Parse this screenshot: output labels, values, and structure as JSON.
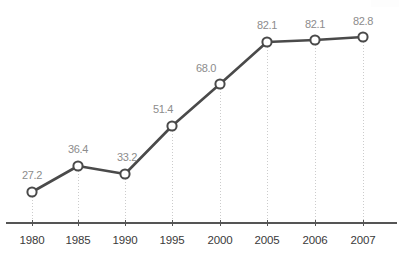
{
  "chart_data": {
    "type": "line",
    "title": "",
    "subtitle": "",
    "xlabel": "",
    "ylabel": "",
    "grid": true,
    "gridlines": "vertical-dotted",
    "legend": "none",
    "categories": [
      "1980",
      "1985",
      "1990",
      "1995",
      "2000",
      "2005",
      "2006",
      "2007"
    ],
    "values": [
      27.2,
      36.4,
      33.2,
      51.4,
      68.0,
      82.1,
      82.1,
      82.8
    ],
    "point_labels": [
      "27.2",
      "36.4",
      "33.2",
      "51.4",
      "68.0",
      "82.1",
      "82.1",
      "82.8"
    ],
    "tick_labels": [
      "1980",
      "1985",
      "1990",
      "1995",
      "2000",
      "2005",
      "2006",
      "2007"
    ],
    "ylim": [
      0,
      82.8
    ],
    "xlim": [
      "1980",
      "2007"
    ],
    "series": [
      {
        "name": "",
        "values": [
          27.2,
          36.4,
          33.2,
          51.4,
          68.0,
          82.1,
          82.1,
          82.8
        ]
      }
    ],
    "marker": "open-circle",
    "colors": {
      "line": "#4a4a4a",
      "marker_fill": "#ffffff",
      "marker_stroke": "#4a4a4a",
      "axis": "#555555",
      "gridline": "#cccccc",
      "value_label": "#8c8c8c",
      "tick_label": "#3a3a3a",
      "background": "#ffffff"
    },
    "points": [
      {
        "category": "1980",
        "value": 27.2,
        "label": "27.2",
        "px": 32,
        "py": 192,
        "lx": 32,
        "ly": 170
      },
      {
        "category": "1985",
        "value": 36.4,
        "label": "36.4",
        "px": 78,
        "py": 166,
        "lx": 78,
        "ly": 144
      },
      {
        "category": "1990",
        "value": 33.2,
        "label": "33.2",
        "px": 125,
        "py": 174,
        "lx": 127,
        "ly": 152
      },
      {
        "category": "1995",
        "value": 51.4,
        "label": "51.4",
        "px": 172,
        "py": 126,
        "lx": 163,
        "ly": 104
      },
      {
        "category": "2000",
        "value": 68.0,
        "label": "68.0",
        "px": 220,
        "py": 84,
        "lx": 206,
        "ly": 63
      },
      {
        "category": "2005",
        "value": 82.1,
        "label": "82.1",
        "px": 267,
        "py": 42,
        "lx": 267,
        "ly": 20
      },
      {
        "category": "2006",
        "value": 82.1,
        "label": "82.1",
        "px": 315,
        "py": 40,
        "lx": 315,
        "ly": 19
      },
      {
        "category": "2007",
        "value": 82.8,
        "label": "82.8",
        "px": 363,
        "py": 37,
        "lx": 363,
        "ly": 16
      }
    ],
    "axis": {
      "baseline_y": 223,
      "x_start": 6,
      "x_end": 397,
      "tick_label_y": 235
    }
  }
}
